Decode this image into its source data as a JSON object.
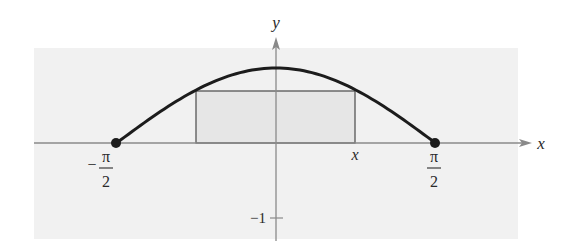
{
  "chart_data": {
    "type": "line",
    "title": "",
    "function": "y = cos x",
    "xlabel": "x",
    "ylabel": "y",
    "x_domain": [
      -1.5708,
      1.5708
    ],
    "xlim": [
      -2.5,
      3.9
    ],
    "ylim": [
      -1.27,
      1.3
    ],
    "grid": false,
    "legend": null,
    "series": [
      {
        "name": "cos x",
        "x": [
          -1.5708,
          -1.1781,
          -0.7854,
          -0.3927,
          0,
          0.3927,
          0.7854,
          1.1781,
          1.5708
        ],
        "y": [
          0,
          0.3827,
          0.7071,
          0.9239,
          1,
          0.9239,
          0.7071,
          0.3827,
          0
        ]
      }
    ],
    "endpoints": [
      {
        "x": -1.5708,
        "y": 0,
        "label": "-π/2"
      },
      {
        "x": 1.5708,
        "y": 0,
        "label": "π/2"
      }
    ],
    "inscribed_rectangle": {
      "x_left": -0.778,
      "x_right": 0.778,
      "height": 0.712,
      "right_corner_label": "x"
    },
    "ticks": {
      "x": [
        {
          "value": -1.5708,
          "numerator": "π",
          "denominator": "2",
          "sign": "−"
        },
        {
          "value": 0.778,
          "label": "x"
        },
        {
          "value": 1.5708,
          "numerator": "π",
          "denominator": "2",
          "sign": ""
        }
      ],
      "y": [
        {
          "value": -1,
          "label": "−1"
        }
      ]
    }
  },
  "labels": {
    "x_axis": "x",
    "y_axis": "y",
    "neg_half_pi_sign": "−",
    "neg_half_pi_num": "π",
    "neg_half_pi_den": "2",
    "pos_half_pi_num": "π",
    "pos_half_pi_den": "2",
    "rect_x": "x",
    "y_tick_neg1": "−1"
  },
  "colors": {
    "panel": "#f1f1f1",
    "rectangle_fill": "#e6e6e6",
    "curve": "#1c1c1c",
    "axis": "#8a8a8a",
    "rectangle_stroke": "#4a4a4a"
  }
}
